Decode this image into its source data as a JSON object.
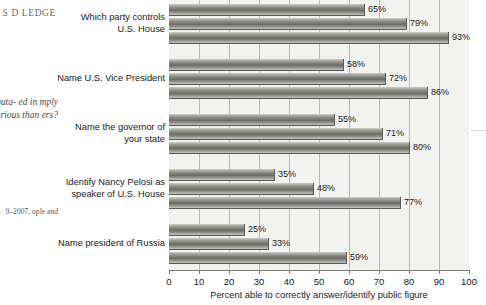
{
  "margin": {
    "heading": "S\nD\nLEDGE",
    "quote": "ence\nributa-\ned in\nmply\ncollege\ncurious\nthan\ners?",
    "source": "9–2007,\nople and"
  },
  "chart_data": {
    "type": "bar",
    "orientation": "horizontal",
    "title": "",
    "xlabel": "Percent able to correctly answer/identify public figure",
    "ylabel": "",
    "xlim": [
      0,
      100
    ],
    "xticks": [
      0,
      10,
      20,
      30,
      40,
      50,
      60,
      70,
      80,
      90,
      100
    ],
    "grid": "vertical",
    "legend": "none",
    "categories": [
      "Which party controls U.S. House",
      "Name U.S. Vice President",
      "Name the governor of your state",
      "Identify Nancy Pelosi as speaker of U.S. House",
      "Name president of Russia"
    ],
    "category_lines": [
      [
        "Which party controls",
        "U.S. House"
      ],
      [
        "Name U.S. Vice President"
      ],
      [
        "Name the governor of",
        "your state"
      ],
      [
        "Identify Nancy Pelosi as",
        "speaker of U.S. House"
      ],
      [
        "Name president of Russia"
      ]
    ],
    "series": [
      {
        "name": "series-1",
        "values": [
          65,
          58,
          55,
          35,
          25
        ]
      },
      {
        "name": "series-2",
        "values": [
          79,
          72,
          71,
          48,
          33
        ]
      },
      {
        "name": "series-3",
        "values": [
          93,
          86,
          80,
          77,
          59
        ]
      }
    ],
    "value_labels": [
      [
        "65%",
        "79%",
        "93%"
      ],
      [
        "58%",
        "72%",
        "86%"
      ],
      [
        "55%",
        "71%",
        "80%"
      ],
      [
        "35%",
        "48%",
        "77%"
      ],
      [
        "25%",
        "33%",
        "59%"
      ]
    ],
    "colors": {
      "bar_light": "#cfcfcb",
      "bar_dark": "#6d6d68",
      "plot_background": "#f2f2f0",
      "gridline": "#b9b9b4",
      "axis": "#7d7d78",
      "text": "#1a1a1a"
    }
  }
}
